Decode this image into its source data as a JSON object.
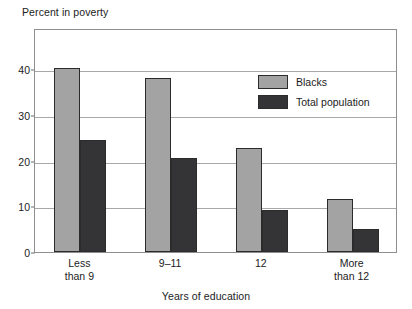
{
  "chart_data": {
    "type": "bar",
    "title": "",
    "xlabel": "Years of education",
    "ylabel": "Percent in poverty",
    "categories": [
      "Less than 9",
      "9–11",
      "12",
      "More than 12"
    ],
    "category_lines": [
      [
        "Less",
        "than 9"
      ],
      [
        "9–11",
        ""
      ],
      [
        "12",
        ""
      ],
      [
        "More",
        "than 12"
      ]
    ],
    "series": [
      {
        "name": "Blacks",
        "color": "#a3a3a3",
        "values": [
          40.3,
          38.0,
          22.7,
          11.6
        ]
      },
      {
        "name": "Total population",
        "color": "#343436",
        "values": [
          24.6,
          20.6,
          9.2,
          5.1
        ]
      }
    ],
    "ylim": [
      0,
      49
    ],
    "yticks": [
      0,
      10,
      20,
      30,
      40
    ],
    "ytick_labels": [
      "0",
      "10",
      "20",
      "30",
      "40"
    ],
    "grid": true,
    "legend_position": "upper right"
  }
}
